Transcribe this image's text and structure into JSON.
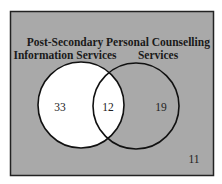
{
  "diagram": {
    "type": "venn",
    "background_color": "#a9a9a9",
    "sets": [
      {
        "name": "Post-Secondary Information Services",
        "label_lines": [
          "Post-Secondary",
          "Information Services"
        ],
        "fill": "#ffffff"
      },
      {
        "name": "Personal Counselling Services",
        "label_lines": [
          "Personal Counselling",
          "Services"
        ],
        "fill": "none"
      }
    ],
    "regions": {
      "only_post_secondary": "33",
      "both": "12",
      "only_personal_counselling": "19",
      "neither": "11"
    }
  }
}
